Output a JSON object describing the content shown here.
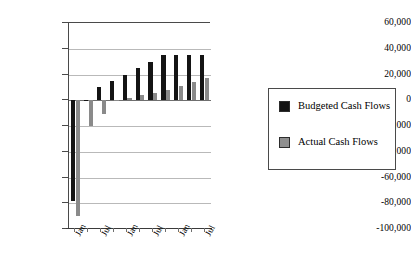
{
  "chart_data": {
    "type": "bar",
    "title": "",
    "subtitle": "",
    "xlabel": "",
    "ylabel": "",
    "ylim": [
      -100000,
      60000
    ],
    "grid": true,
    "grid_axis": "y",
    "legend_position": "right",
    "orientation": "vertical",
    "categories": [
      "Jan",
      "",
      "Jul",
      "",
      "Jan",
      "",
      "Jul",
      "",
      "Jan",
      "",
      "Jul"
    ],
    "x_tick_labels": [
      "Jan",
      "Jul",
      "Jan",
      "Jul",
      "Jan",
      "Jul"
    ],
    "y_tick_labels": [
      "60,000",
      "40,000",
      "20,000",
      "0",
      "-20,000",
      "-40,000",
      "-60,000",
      "-80,000",
      "-100,000"
    ],
    "y_tick_values": [
      60000,
      40000,
      20000,
      0,
      -20000,
      -40000,
      -60000,
      -80000,
      -100000
    ],
    "series": [
      {
        "name": "Budgeted Cash Flows",
        "color": "#141414",
        "values": [
          -78000,
          0,
          10000,
          15000,
          20000,
          25000,
          30000,
          35000,
          35000,
          35000,
          35000
        ]
      },
      {
        "name": "Actual Cash Flows",
        "color": "#8a8a8a",
        "values": [
          -90000,
          -20000,
          -11000,
          0,
          1500,
          4000,
          6000,
          8000,
          11000,
          14000,
          17000
        ]
      }
    ]
  },
  "legend": {
    "entries": [
      {
        "label": "Budgeted Cash Flows",
        "swatch": "budget"
      },
      {
        "label": "Actual Cash Flows",
        "swatch": "actual"
      }
    ]
  },
  "colors": {
    "budgeted": "#141414",
    "actual": "#8a8a8a",
    "gridline": "#b9b9b9",
    "axis": "#4a4a4a",
    "background": "#ffffff"
  }
}
